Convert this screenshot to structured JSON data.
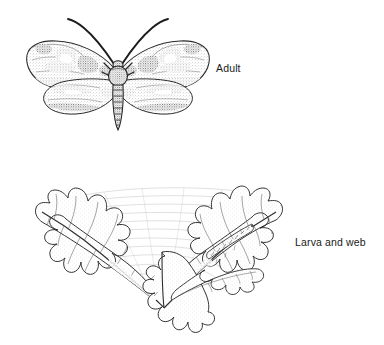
{
  "plate": {
    "title": "Moth life stages illustration",
    "background_color": "#ffffff",
    "ink_color": "#222222",
    "width": 384,
    "height": 345
  },
  "labels": {
    "adult": "Adult",
    "larva": "Larva and web"
  },
  "figures": [
    {
      "id": "adult-moth",
      "name": "adult-moth-illustration",
      "label": "Adult",
      "description": "Dorsal view of an adult moth with spread wings, stippled shading, dark wavy bands on forewings and hindwings, long curved antennae, and a segmented tapering abdomen.",
      "parts": [
        "left-forewing",
        "right-forewing",
        "left-hindwing",
        "right-hindwing",
        "thorax",
        "abdomen",
        "left-antenna",
        "right-antenna",
        "head",
        "legs"
      ],
      "abdomen_segments": 7
    },
    {
      "id": "larva-and-web",
      "name": "larva-and-web-illustration",
      "label": "Larva and web",
      "description": "Cluster of serrated elm-like leaves radiating from a common petiole junction, overlaid with fine silk webbing strands; a small caterpillar rests along a leaf midrib at upper right.",
      "parts": [
        "upper-left-leaf",
        "upper-right-leaf",
        "lower-center-leaf",
        "right-lower-leaf",
        "silk-web",
        "caterpillar",
        "petiole-junction"
      ],
      "leaf_count": 4
    }
  ],
  "icons": {
    "moth": "moth-icon",
    "leaf": "leaf-icon",
    "caterpillar": "caterpillar-icon",
    "web": "web-icon"
  }
}
